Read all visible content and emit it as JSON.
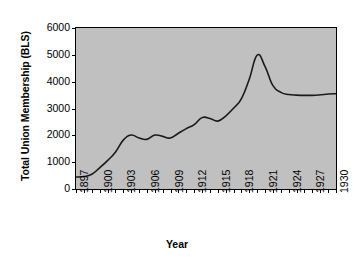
{
  "chart_data": {
    "type": "line",
    "title": "",
    "xlabel": "Year",
    "ylabel": "Total Union Membership (BLS)",
    "xlim": [
      1897,
      1930
    ],
    "ylim": [
      0,
      6000
    ],
    "ytick_labels": [
      "0",
      "1000",
      "2000",
      "3000",
      "4000",
      "5000",
      "6000"
    ],
    "ytick_values": [
      0,
      1000,
      2000,
      3000,
      4000,
      5000,
      6000
    ],
    "xtick_labels": [
      "1897",
      "1900",
      "1903",
      "1906",
      "1909",
      "1912",
      "1915",
      "1918",
      "1921",
      "1924",
      "1927",
      "1930"
    ],
    "xtick_values": [
      1897,
      1900,
      1903,
      1906,
      1909,
      1912,
      1915,
      1918,
      1921,
      1924,
      1927,
      1930
    ],
    "xtick_minor_step": 1,
    "grid": false,
    "legend": false,
    "plot_background_color": "#c0c0c0",
    "line_color": "#1a1a1a",
    "line_width": 1.6,
    "x": [
      1897,
      1898,
      1899,
      1900,
      1901,
      1902,
      1903,
      1904,
      1905,
      1906,
      1907,
      1908,
      1909,
      1910,
      1911,
      1912,
      1913,
      1914,
      1915,
      1916,
      1917,
      1918,
      1919,
      1920,
      1921,
      1922,
      1923,
      1924,
      1925,
      1926,
      1927,
      1928,
      1929,
      1930
    ],
    "series": [
      {
        "name": "Total Union Membership (BLS)",
        "values": [
          447,
          465,
          550,
          790,
          1060,
          1370,
          1820,
          2010,
          1900,
          1850,
          2010,
          1960,
          1900,
          2080,
          2250,
          2400,
          2660,
          2630,
          2530,
          2720,
          3010,
          3370,
          4100,
          4990,
          4560,
          3850,
          3600,
          3520,
          3500,
          3490,
          3490,
          3510,
          3540,
          3550
        ]
      }
    ],
    "annotations": []
  }
}
